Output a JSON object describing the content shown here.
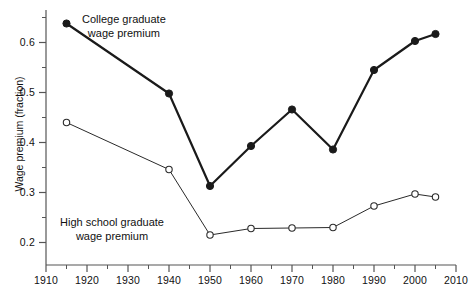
{
  "chart_data": {
    "type": "line",
    "title": "",
    "subtitle": "",
    "xlabel": "",
    "ylabel": "Wage premium (fraction)",
    "xlim": [
      1910,
      2010
    ],
    "ylim": [
      0.155,
      0.665
    ],
    "grid": false,
    "legend_position": "inline-annotation",
    "x_ticks_major": [
      1910,
      1920,
      1930,
      1940,
      1950,
      1960,
      1970,
      1980,
      1990,
      2000,
      2010
    ],
    "x_tick_labels": [
      "1910",
      "1920",
      "1930",
      "1940",
      "1950",
      "1960",
      "1970",
      "1980",
      "1990",
      "2000",
      "2010"
    ],
    "x_ticks_minor": [
      1915,
      1925,
      1935,
      1945,
      1955,
      1965,
      1975,
      1985,
      1995,
      2005
    ],
    "y_ticks_major": [
      0.2,
      0.3,
      0.4,
      0.5,
      0.6
    ],
    "y_tick_labels": [
      "0.2",
      "0.3",
      "0.4",
      "0.5",
      "0.6"
    ],
    "y_ticks_minor": [
      0.25,
      0.35,
      0.45,
      0.55,
      0.65
    ],
    "series": [
      {
        "name": "College graduate wage premium",
        "marker": "filled-circle",
        "color": "#1a1a1a",
        "line_width": 2.2,
        "x": [
          1915,
          1940,
          1950,
          1960,
          1970,
          1980,
          1990,
          2000,
          2005
        ],
        "values": [
          0.638,
          0.498,
          0.313,
          0.393,
          0.466,
          0.386,
          0.545,
          0.603,
          0.617
        ]
      },
      {
        "name": "High school graduate wage premium",
        "marker": "open-circle",
        "color": "#2a2a2a",
        "line_width": 1.0,
        "x": [
          1915,
          1940,
          1950,
          1960,
          1970,
          1980,
          1990,
          2000,
          2005
        ],
        "values": [
          0.44,
          0.346,
          0.215,
          0.228,
          0.229,
          0.23,
          0.273,
          0.297,
          0.291
        ]
      }
    ],
    "annotations": [
      {
        "id": "college-annotation",
        "text": "College graduate\nwage premium",
        "refers_to": "College graduate wage premium"
      },
      {
        "id": "highschool-annotation",
        "text": "High school graduate\nwage premium",
        "refers_to": "High school graduate wage premium"
      }
    ]
  }
}
